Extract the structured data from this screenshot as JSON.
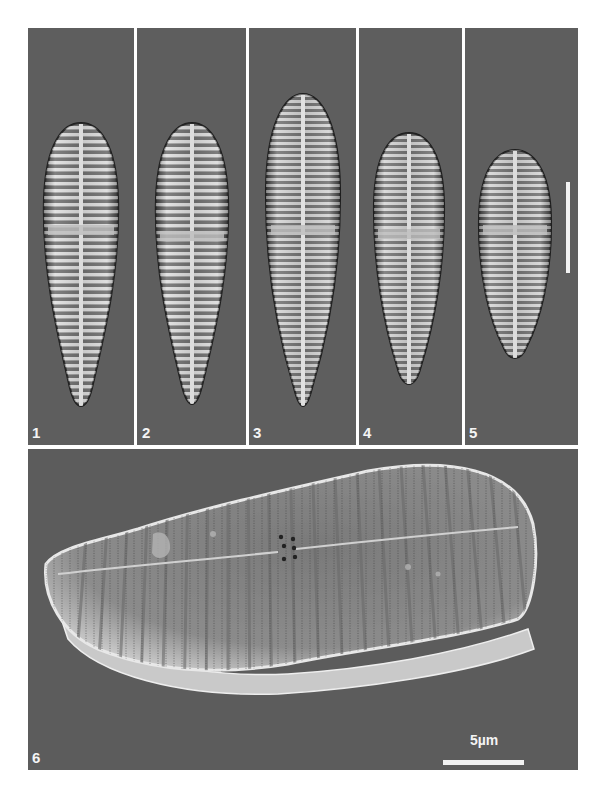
{
  "figure": {
    "background": "#ffffff",
    "panel_background": "#5e5e5e",
    "label_color": "#f4f4f4",
    "panels": [
      {
        "id": "1",
        "label": "1",
        "type": "LM",
        "description": "light micrograph of diatom valve, lanceolate with subcapitate apices"
      },
      {
        "id": "2",
        "label": "2",
        "type": "LM",
        "description": "light micrograph of diatom valve"
      },
      {
        "id": "3",
        "label": "3",
        "type": "LM",
        "description": "light micrograph of diatom valve"
      },
      {
        "id": "4",
        "label": "4",
        "type": "LM",
        "description": "light micrograph of diatom valve, shorter"
      },
      {
        "id": "5",
        "label": "5",
        "type": "LM",
        "description": "light micrograph of diatom valve, shortest, clavate"
      },
      {
        "id": "6",
        "label": "6",
        "type": "SEM",
        "description": "scanning electron micrograph, external view of whole valve"
      }
    ],
    "scale_bars": {
      "lm": {
        "panel": "5",
        "orientation": "vertical",
        "label": ""
      },
      "sem": {
        "panel": "6",
        "orientation": "horizontal",
        "label": "5µm"
      }
    }
  }
}
